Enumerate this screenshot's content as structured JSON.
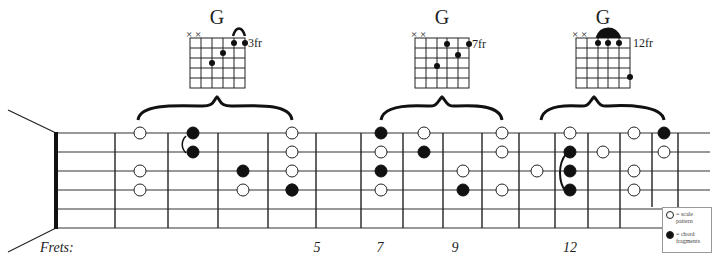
{
  "chord_diagrams": [
    {
      "name": "G",
      "position_label": "3fr",
      "muted": "× ×"
    },
    {
      "name": "G",
      "position_label": "7fr",
      "muted": "× ×"
    },
    {
      "name": "G",
      "position_label": "12fr",
      "muted": "× ×"
    }
  ],
  "fretboard": {
    "frets_title": "Frets:",
    "fret_labels": [
      {
        "label": "5",
        "x": 317
      },
      {
        "label": "7",
        "x": 380
      },
      {
        "label": "9",
        "x": 455
      },
      {
        "label": "12",
        "x": 570
      },
      {
        "label": "15",
        "x": 680
      }
    ]
  },
  "legend": {
    "scale_label": "= scale pattern",
    "chord_label": "= chord fragments"
  },
  "colors": {
    "line": "#222222",
    "open_fill": "#ffffff",
    "filled_fill": "#111111"
  }
}
